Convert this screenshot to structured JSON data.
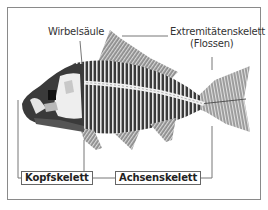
{
  "diagram": {
    "labels": {
      "spine": "Wirbelsäule",
      "limb_skeleton_line1": "Extremitätenskelett",
      "limb_skeleton_line2": "(Flossen)",
      "head_skeleton": "Kopfskelett",
      "axial_skeleton": "Achsenskelett"
    },
    "colors": {
      "frame": "#8a8a8a",
      "leader_lines": "#777777",
      "bone_dark": "#3a3a3a",
      "bone_light": "#e8e8e8",
      "fin_grey": "#9a9a9a"
    }
  }
}
